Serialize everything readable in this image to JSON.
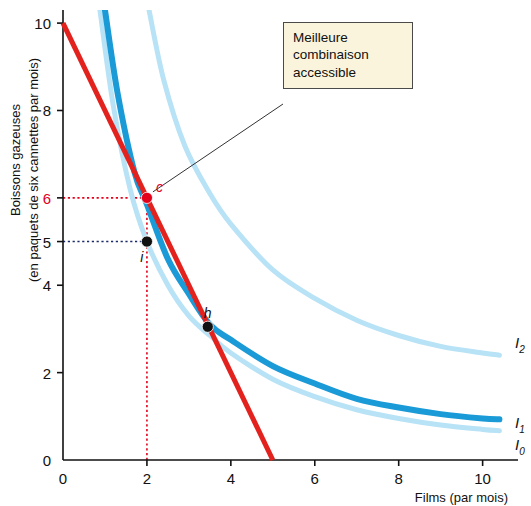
{
  "callout": {
    "line1": "Meilleure",
    "line2": "combinaison",
    "line3": "accessible"
  },
  "chart_data": {
    "type": "line",
    "title": "",
    "xlabel": "Films (par mois)",
    "ylabel": "Boissons gazeuses (en paquets de six cannettes par mois)",
    "ylabel_line1": "Boissons gazeuses",
    "ylabel_line2": "(en paquets de six cannettes par mois)",
    "xlim": [
      0,
      10.7
    ],
    "ylim": [
      0,
      10.3
    ],
    "xticks": [
      0,
      2,
      4,
      6,
      8,
      10
    ],
    "yticks": [
      2,
      4,
      5,
      6,
      8,
      10
    ],
    "xtick_labels": [
      "0",
      "2",
      "4",
      "6",
      "8",
      "10"
    ],
    "ytick_labels": [
      "2",
      "4",
      "5",
      "6",
      "8",
      "10"
    ],
    "grid": false,
    "highlight_tick": "6",
    "highlight_tick_color": "#e3001b",
    "series": [
      {
        "name": "Budget line",
        "type": "line",
        "color": "#e3211d",
        "width": 5,
        "points": [
          [
            0,
            10
          ],
          [
            5,
            0
          ]
        ]
      },
      {
        "name": "I0",
        "label": "I",
        "sub": "0",
        "type": "curve",
        "color": "#b8e2f5",
        "width": 5,
        "points": [
          [
            0.88,
            10.3
          ],
          [
            1.2,
            8.1
          ],
          [
            1.6,
            6.2
          ],
          [
            2.0,
            5.0
          ],
          [
            2.5,
            4.0
          ],
          [
            3.0,
            3.3
          ],
          [
            3.5,
            2.85
          ],
          [
            4.0,
            2.45
          ],
          [
            5.0,
            1.85
          ],
          [
            6.0,
            1.45
          ],
          [
            7.0,
            1.15
          ],
          [
            8.0,
            0.95
          ],
          [
            9.0,
            0.8
          ],
          [
            10.0,
            0.7
          ],
          [
            10.4,
            0.67
          ]
        ]
      },
      {
        "name": "I1",
        "label": "I",
        "sub": "1",
        "type": "curve",
        "color": "#1a9ad6",
        "width": 6,
        "points": [
          [
            1.0,
            10.3
          ],
          [
            1.3,
            8.4
          ],
          [
            1.7,
            6.6
          ],
          [
            2.0,
            5.85
          ],
          [
            2.5,
            4.6
          ],
          [
            3.0,
            3.8
          ],
          [
            3.5,
            3.1
          ],
          [
            4.0,
            2.75
          ],
          [
            5.0,
            2.15
          ],
          [
            6.0,
            1.75
          ],
          [
            7.0,
            1.4
          ],
          [
            8.0,
            1.2
          ],
          [
            9.0,
            1.05
          ],
          [
            10.0,
            0.95
          ],
          [
            10.4,
            0.93
          ]
        ]
      },
      {
        "name": "I2",
        "label": "I",
        "sub": "2",
        "type": "curve",
        "color": "#b8e2f5",
        "width": 5,
        "points": [
          [
            2.05,
            10.3
          ],
          [
            2.4,
            8.7
          ],
          [
            2.9,
            7.2
          ],
          [
            3.5,
            6.1
          ],
          [
            4.0,
            5.4
          ],
          [
            5.0,
            4.35
          ],
          [
            6.0,
            3.7
          ],
          [
            7.0,
            3.2
          ],
          [
            8.0,
            2.85
          ],
          [
            9.0,
            2.6
          ],
          [
            10.0,
            2.45
          ],
          [
            10.4,
            2.4
          ]
        ]
      }
    ],
    "points": [
      {
        "name": "c",
        "label": "c",
        "x": 2.0,
        "y": 6.0,
        "color": "#e3001b",
        "label_color": "#e3001b"
      },
      {
        "name": "i",
        "label": "i",
        "x": 2.0,
        "y": 5.0,
        "color": "#111111",
        "label_color": "#111111"
      },
      {
        "name": "h",
        "label": "h",
        "x": 3.45,
        "y": 3.05,
        "color": "#111111",
        "label_color": "#111111"
      }
    ],
    "annotations": [
      {
        "name": "callout",
        "text": "Meilleure combinaison accessible",
        "points_to": "c"
      }
    ],
    "guides": [
      {
        "name": "guide-c-horizontal",
        "from": [
          0,
          6
        ],
        "to": [
          2,
          6
        ],
        "color": "#e3001b",
        "style": "dotted"
      },
      {
        "name": "guide-c-vertical",
        "from": [
          2,
          0
        ],
        "to": [
          2,
          6
        ],
        "color": "#e3001b",
        "style": "dotted"
      },
      {
        "name": "guide-i-horizontal",
        "from": [
          0,
          5
        ],
        "to": [
          2,
          5
        ],
        "color": "#1b2a6b",
        "style": "dotted"
      }
    ]
  }
}
